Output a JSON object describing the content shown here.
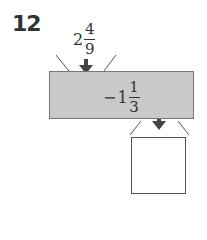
{
  "problem": {
    "number": "12",
    "input": {
      "whole": "2",
      "numerator": "4",
      "denominator": "9"
    },
    "operation": {
      "sign": "−",
      "whole": "1",
      "numerator": "1",
      "denominator": "3"
    },
    "output_box": {
      "value": ""
    }
  },
  "colors": {
    "machine_fill": "#c9c9c9",
    "arrow": "#444444",
    "text": "#333333"
  }
}
